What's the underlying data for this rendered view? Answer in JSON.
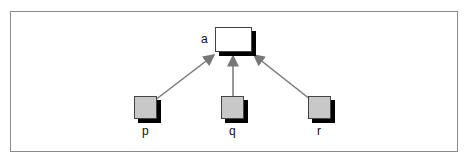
{
  "diagram": {
    "type": "tree",
    "nodes": [
      {
        "id": "a",
        "label": "a",
        "fill": "#ffffff",
        "role": "root"
      },
      {
        "id": "p",
        "label": "p",
        "fill": "#c8c8c8",
        "role": "leaf"
      },
      {
        "id": "q",
        "label": "q",
        "fill": "#c8c8c8",
        "role": "leaf"
      },
      {
        "id": "r",
        "label": "r",
        "fill": "#c8c8c8",
        "role": "leaf"
      }
    ],
    "edges": [
      {
        "from": "p",
        "to": "a"
      },
      {
        "from": "q",
        "to": "a"
      },
      {
        "from": "r",
        "to": "a"
      }
    ],
    "colors": {
      "edge": "#777777",
      "shadow": "#000000",
      "border": "#8a8a8a"
    }
  }
}
